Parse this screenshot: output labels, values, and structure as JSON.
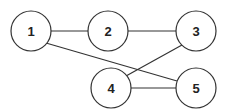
{
  "diagram": {
    "type": "undirected-graph",
    "nodes": [
      {
        "id": "1",
        "label": "1",
        "x": 31,
        "y": 31
      },
      {
        "id": "2",
        "label": "2",
        "x": 108,
        "y": 31
      },
      {
        "id": "3",
        "label": "3",
        "x": 196,
        "y": 31
      },
      {
        "id": "4",
        "label": "4",
        "x": 111,
        "y": 88
      },
      {
        "id": "5",
        "label": "5",
        "x": 196,
        "y": 88
      }
    ],
    "edges": [
      {
        "from": "1",
        "to": "2"
      },
      {
        "from": "2",
        "to": "3"
      },
      {
        "from": "1",
        "to": "5"
      },
      {
        "from": "3",
        "to": "4"
      },
      {
        "from": "4",
        "to": "5"
      }
    ],
    "node_radius": 20,
    "stroke_color": "#333333"
  }
}
